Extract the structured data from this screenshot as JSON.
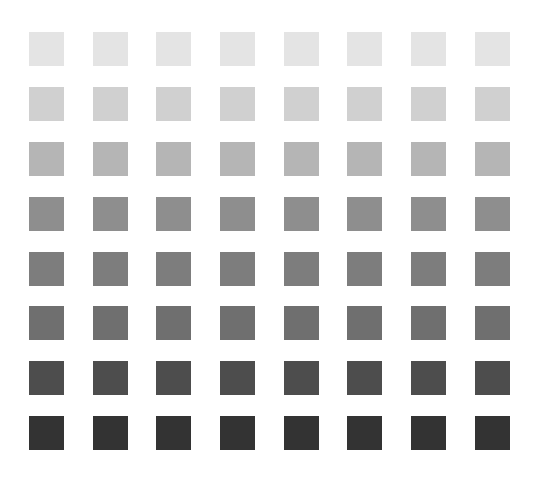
{
  "grid": {
    "rows": 8,
    "columns": 8,
    "row_colors": [
      "#e4e4e4",
      "#d0d0d0",
      "#b5b5b5",
      "#8e8e8e",
      "#7d7d7d",
      "#6f6f6f",
      "#4d4d4d",
      "#333333"
    ]
  }
}
